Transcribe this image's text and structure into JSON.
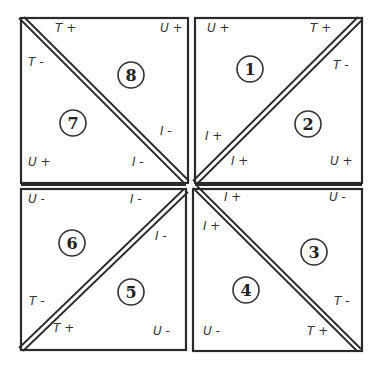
{
  "diagram": {
    "type": "quadrant-triangle-map",
    "colors": {
      "line": "#2a2a2a",
      "text": "#333333",
      "background": "#ffffff"
    },
    "quadrants": [
      {
        "position": "top-left",
        "diagonal": "top-left-to-bottom-right",
        "regions": [
          {
            "id": "8",
            "label": "8"
          },
          {
            "id": "7",
            "label": "7"
          }
        ],
        "labels": {
          "top": "T +",
          "top_right": "U +",
          "left_upper": "T -",
          "bottom_left": "U +",
          "right_lower": "I -",
          "bottom_inner": "I -"
        }
      },
      {
        "position": "top-right",
        "diagonal": "bottom-left-to-top-right",
        "regions": [
          {
            "id": "1",
            "label": "1"
          },
          {
            "id": "2",
            "label": "2"
          }
        ],
        "labels": {
          "top_left": "U +",
          "top_inner": "T +",
          "right_upper": "T -",
          "left_lower": "I +",
          "bottom_inner": "I +",
          "bottom_right": "U +"
        }
      },
      {
        "position": "bottom-left",
        "diagonal": "bottom-left-to-top-right",
        "regions": [
          {
            "id": "6",
            "label": "6"
          },
          {
            "id": "5",
            "label": "5"
          }
        ],
        "labels": {
          "top_left": "U -",
          "top_inner": "I -",
          "right_upper": "I -",
          "left_lower": "T -",
          "bottom_inner": "T +",
          "bottom_right": "U -"
        }
      },
      {
        "position": "bottom-right",
        "diagonal": "top-left-to-bottom-right",
        "regions": [
          {
            "id": "3",
            "label": "3"
          },
          {
            "id": "4",
            "label": "4"
          }
        ],
        "labels": {
          "top_inner": "I +",
          "top_right": "U -",
          "left_upper": "I +",
          "right_lower": "T -",
          "bottom_left": "U  -",
          "bottom_inner": "T +"
        }
      }
    ]
  },
  "text": {
    "q_tl": {
      "t_plus": "T +",
      "u_plus": "U +",
      "t_minus": "T -",
      "u_plus_b": "U +",
      "i_minus_r": "I -",
      "i_minus_b": "I -",
      "n8": "8",
      "n7": "7"
    },
    "q_tr": {
      "u_plus": "U +",
      "t_plus": "T +",
      "t_minus": "T -",
      "i_plus_l": "I +",
      "i_plus_b": "I +",
      "u_plus_b": "U +",
      "n1": "1",
      "n2": "2"
    },
    "q_bl": {
      "u_minus": "U -",
      "i_minus_t": "I -",
      "i_minus_r": "I -",
      "t_minus": "T -",
      "t_plus": "T +",
      "u_minus_b": "U -",
      "n6": "6",
      "n5": "5"
    },
    "q_br": {
      "i_plus_t": "I +",
      "u_minus": "U -",
      "i_plus_l": "I +",
      "t_minus": "T -",
      "u_minus_b": "U  -",
      "t_plus": "T +",
      "n3": "3",
      "n4": "4"
    }
  }
}
